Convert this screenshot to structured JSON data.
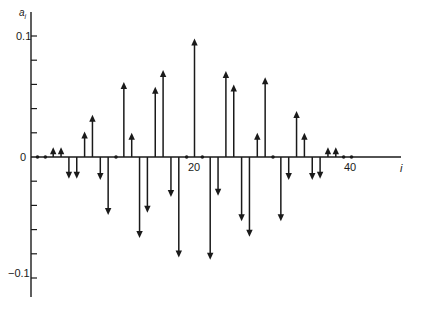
{
  "chart_data": {
    "type": "stem",
    "title": "",
    "xlabel": "i",
    "ylabel": "a_i",
    "x_ticks": [
      20,
      40
    ],
    "y_ticks": [
      0.1,
      0,
      -0.1
    ],
    "y_tick_labels": [
      "0.1",
      "0",
      "−0.1"
    ],
    "y_minor_step": 0.02,
    "ylim": [
      -0.12,
      0.12
    ],
    "xlim": [
      0,
      46
    ],
    "grid": false,
    "legend": null,
    "x": [
      0,
      1,
      2,
      3,
      4,
      5,
      6,
      7,
      8,
      9,
      10,
      11,
      12,
      13,
      14,
      15,
      16,
      17,
      18,
      19,
      20,
      21,
      22,
      23,
      24,
      25,
      26,
      27,
      28,
      29,
      30,
      31,
      32,
      33,
      34,
      35,
      36,
      37,
      38,
      39,
      40
    ],
    "values": [
      0,
      0,
      0.008,
      0.008,
      -0.018,
      -0.018,
      0.021,
      0.035,
      -0.019,
      -0.048,
      0,
      0.062,
      0.02,
      -0.067,
      -0.046,
      0.058,
      0.072,
      -0.033,
      -0.083,
      0,
      0.098,
      0,
      -0.085,
      -0.032,
      0.071,
      0.06,
      -0.053,
      -0.066,
      0.02,
      0.066,
      0,
      -0.053,
      -0.019,
      0.038,
      0.02,
      -0.019,
      -0.018,
      0.008,
      0.008,
      0,
      0
    ]
  },
  "labels": {
    "y_axis": "a",
    "y_axis_sub": "i",
    "x_axis": "i",
    "tick_20": "20",
    "tick_40": "40",
    "y_pos": "0.1",
    "y_zero": "0",
    "y_neg": "−0.1"
  }
}
